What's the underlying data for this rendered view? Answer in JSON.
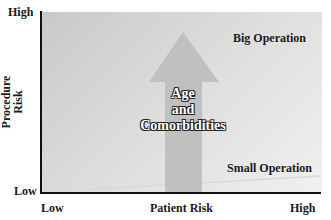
{
  "y_axis": {
    "title_line1": "Procedure",
    "title_line2": "Risk",
    "high_label": "High",
    "low_label": "Low"
  },
  "x_axis": {
    "title": "Patient Risk",
    "low_label": "Low",
    "high_label": "High"
  },
  "lines": {
    "big": {
      "label": "Big Operation",
      "color": "#d6d6d6"
    },
    "small": {
      "label": "Small Operation",
      "color": "#d6d6d6"
    }
  },
  "arrow": {
    "line1": "Age",
    "line2": "and",
    "line3": "Comorbidities",
    "color": "#bdbdbd"
  },
  "colors": {
    "axis": "#111111",
    "background_top": "#c9c9c9",
    "background_bottom": "#f0f0f0"
  }
}
